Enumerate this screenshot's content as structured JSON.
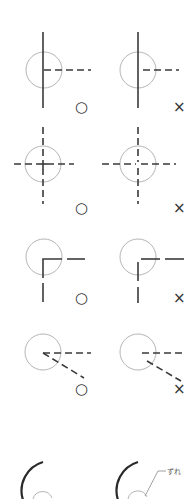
{
  "diagram": {
    "colors": {
      "line": "#3a3a3a",
      "circle": "#b5b5b5",
      "leader": "#888888"
    },
    "rows": [
      {
        "id": "row-1",
        "correct_mark": "○",
        "incorrect_mark": "×"
      },
      {
        "id": "row-2",
        "correct_mark": "○",
        "incorrect_mark": "×"
      },
      {
        "id": "row-3",
        "correct_mark": "○",
        "incorrect_mark": "×"
      },
      {
        "id": "row-4",
        "correct_mark": "○",
        "incorrect_mark": "×"
      }
    ],
    "bottom": {
      "callout_label": "ずれ"
    }
  }
}
